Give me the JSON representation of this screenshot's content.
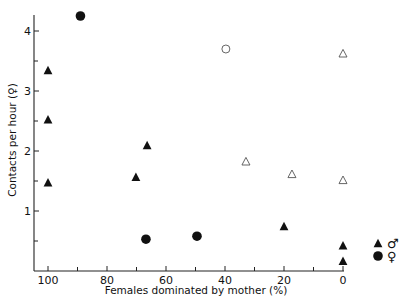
{
  "chart_data": {
    "type": "scatter",
    "title": "",
    "xlabel": "Females dominated by mother (%)",
    "ylabel": "Contacts per hour (♀)",
    "xlim": [
      100,
      0
    ],
    "x_reversed": true,
    "ylim": [
      0,
      4.27
    ],
    "xticks": [
      100,
      80,
      60,
      40,
      20,
      0
    ],
    "xminor_ticks": [
      90,
      70,
      50,
      30,
      10
    ],
    "yticks": [
      1,
      2,
      3,
      4
    ],
    "yminor_ticks": [
      0.5,
      1.5,
      2.5,
      3.5
    ],
    "grid": false,
    "legend_position": "right-bottom",
    "series": [
      {
        "name": "♂ (filled triangle)",
        "marker": "triangle",
        "filled": true,
        "points": [
          {
            "x": 100,
            "y": 3.35
          },
          {
            "x": 100,
            "y": 2.53
          },
          {
            "x": 100,
            "y": 1.48
          },
          {
            "x": 66.4,
            "y": 2.1
          },
          {
            "x": 70.2,
            "y": 1.57
          },
          {
            "x": 20,
            "y": 0.75
          },
          {
            "x": 0,
            "y": 0.43
          },
          {
            "x": 0,
            "y": 0.17
          }
        ]
      },
      {
        "name": "♀ (filled circle)",
        "marker": "circle",
        "filled": true,
        "points": [
          {
            "x": 89,
            "y": 4.25
          },
          {
            "x": 66.8,
            "y": 0.53
          },
          {
            "x": 49.5,
            "y": 0.58
          }
        ]
      },
      {
        "name": "open triangle",
        "marker": "triangle",
        "filled": false,
        "points": [
          {
            "x": 0,
            "y": 3.63
          },
          {
            "x": 32.9,
            "y": 1.83
          },
          {
            "x": 17.3,
            "y": 1.62
          },
          {
            "x": 0,
            "y": 1.52
          }
        ]
      },
      {
        "name": "open circle",
        "marker": "circle",
        "filled": false,
        "points": [
          {
            "x": 39.7,
            "y": 3.7
          }
        ]
      }
    ],
    "legend": [
      {
        "marker": "triangle",
        "filled": true,
        "label": "♂"
      },
      {
        "marker": "circle",
        "filled": true,
        "label": "♀"
      }
    ]
  }
}
